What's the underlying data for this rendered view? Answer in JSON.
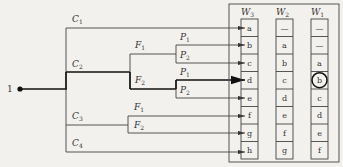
{
  "diagram": {
    "start_node": {
      "label": "1"
    },
    "branches": [
      {
        "label": "C",
        "sub": "1"
      },
      {
        "label": "C",
        "sub": "2",
        "children": [
          {
            "label": "F",
            "sub": "1",
            "children": [
              {
                "label": "P",
                "sub": "1"
              },
              {
                "label": "P",
                "sub": "2"
              }
            ]
          },
          {
            "label": "F",
            "sub": "2",
            "children": [
              {
                "label": "P",
                "sub": "1",
                "highlighted": true
              },
              {
                "label": "P",
                "sub": "2"
              }
            ]
          }
        ]
      },
      {
        "label": "C",
        "sub": "3",
        "children": [
          {
            "label": "F",
            "sub": "1"
          },
          {
            "label": "F",
            "sub": "2"
          }
        ]
      },
      {
        "label": "C",
        "sub": "4"
      }
    ],
    "columns": [
      {
        "header": "W",
        "sub": "3",
        "cells": [
          "a",
          "b",
          "c",
          "d",
          "e",
          "f",
          "g",
          "h"
        ]
      },
      {
        "header": "W",
        "sub": "2",
        "cells": [
          "—",
          "a",
          "b",
          "c",
          "d",
          "e",
          "f",
          "g"
        ]
      },
      {
        "header": "W",
        "sub": "1",
        "cells": [
          "—",
          "—",
          "a",
          "b",
          "c",
          "d",
          "e",
          "f"
        ],
        "circled_index": 3
      }
    ]
  }
}
